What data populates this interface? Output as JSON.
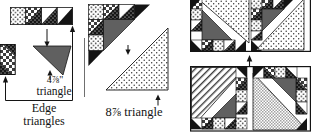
{
  "diagram": {
    "labels": {
      "small_triangle_size": "4⅞\"",
      "small_triangle_word": "triangle",
      "edge_triangles_line1": "Edge",
      "edge_triangles_line2": "triangles",
      "large_triangle_label": "8⅞ triangle"
    },
    "colors": {
      "ink": "#141414",
      "fabric_gray": "#606060",
      "paper": "#ffffff"
    }
  }
}
